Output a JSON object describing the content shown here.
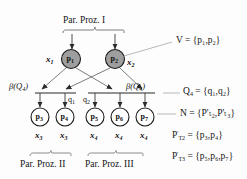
{
  "diagram": {
    "title_top": "Par. Proz. I",
    "caption_left": "Par. Proz. II",
    "caption_right": "Par. Proz. III",
    "beta_left": "β(Q",
    "beta_left_sub": "4",
    "beta_left_end": ")",
    "beta_right": "β(Q",
    "beta_right_sub": "4",
    "beta_right_end": ")",
    "q_left": "q",
    "q_left_sub": "1",
    "q_right": "q",
    "q_right_sub": "2",
    "colors": {
      "node_fill_top": "#9e9e9e",
      "node_fill_bottom": "#ffffff",
      "node_stroke": "#1a1a1a",
      "edge": "#4a4a4a",
      "leader": "#8a8a8a",
      "text": "#141414",
      "background": "#fdfdfd"
    },
    "top_nodes": [
      {
        "name": "p",
        "sub": "1",
        "x_label": "x",
        "x_sub": "1",
        "x_side": "left"
      },
      {
        "name": "p",
        "sub": "2",
        "x_label": "x",
        "x_sub": "2",
        "x_side": "right"
      }
    ],
    "bottom_nodes": [
      {
        "name": "p",
        "sub": "3",
        "x_label": "x",
        "x_sub": "3"
      },
      {
        "name": "p",
        "sub": "4",
        "x_label": "x",
        "x_sub": "3"
      },
      {
        "name": "p",
        "sub": "5",
        "x_label": "x",
        "x_sub": "4"
      },
      {
        "name": "p",
        "sub": "6",
        "x_label": "x",
        "x_sub": "4"
      },
      {
        "name": "p",
        "sub": "7",
        "x_label": "x",
        "x_sub": "4"
      }
    ],
    "annotations": [
      {
        "id": "V",
        "lhs": "V",
        "eq": "=",
        "set": "{p₁,p₂}",
        "plain": "V = {p1,p2}"
      },
      {
        "id": "Q4",
        "lhs": "Q",
        "lhs_sub": "4",
        "eq": "=",
        "set": "{q₁,q₂}",
        "plain": "Q4 = {q1,q2}"
      },
      {
        "id": "N",
        "lhs": "N",
        "eq": "=",
        "set": "{P'ₜ₂,P'ₜ₃}",
        "plain": "N = {P'T2,P'T3}"
      },
      {
        "id": "PT2",
        "lhs": "P",
        "lhs_sub": "T2",
        "lhs_sup": "'",
        "eq": "=",
        "set": "{p₃,p₄}",
        "plain": "P'T2 = {p3,p4}"
      },
      {
        "id": "PT3",
        "lhs": "P",
        "lhs_sub": "T3",
        "lhs_sup": "'",
        "eq": "=",
        "set": "{p₅,p₆,p₇}",
        "plain": "P'T3 = {p5,p6,p7}"
      }
    ]
  }
}
